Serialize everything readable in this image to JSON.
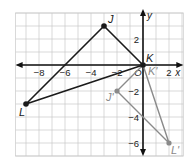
{
  "diagram": {
    "type": "coordinate-plane-transformation",
    "axes": {
      "x_label": "x",
      "y_label": "y",
      "x_ticks": [
        {
          "value": -8,
          "label": "−8"
        },
        {
          "value": -6,
          "label": "−6"
        },
        {
          "value": -4,
          "label": "−4"
        },
        {
          "value": -2,
          "label": "−2"
        },
        {
          "value": 0,
          "label": "O"
        },
        {
          "value": 2,
          "label": "2"
        }
      ],
      "y_ticks": [
        {
          "value": 2,
          "label": "2"
        },
        {
          "value": -2,
          "label": "−2"
        },
        {
          "value": -4,
          "label": "−4"
        },
        {
          "value": -6,
          "label": "−6"
        }
      ],
      "x_range": [
        -9.8,
        3.1
      ],
      "y_range": [
        -7,
        4
      ]
    },
    "preimage": {
      "color": "#1a1a1a",
      "vertices": [
        {
          "name": "J",
          "x": -3,
          "y": 3
        },
        {
          "name": "K",
          "x": 0,
          "y": 0
        },
        {
          "name": "L",
          "x": -9,
          "y": -3
        }
      ]
    },
    "image": {
      "color": "#8a8a8a",
      "vertices": [
        {
          "name": "K'",
          "x": 0,
          "y": 0
        },
        {
          "name": "J'",
          "x": -2,
          "y": -2
        },
        {
          "name": "L'",
          "x": 2,
          "y": -6
        }
      ]
    },
    "grid_color": "#c9c9c9"
  }
}
